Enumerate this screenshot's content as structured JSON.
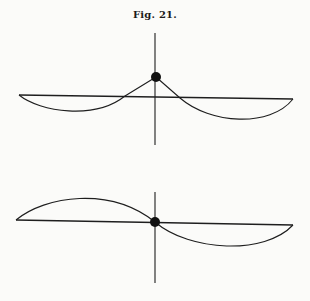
{
  "figure": {
    "title": "Fig. 21.",
    "ink_color": "#1e1e1e",
    "paper_color": "#fbfbf9",
    "panels": [
      {
        "name": "top",
        "description": "Taut string raised at center point; two sagging arcs below baseline",
        "baseline": {
          "x1": 19,
          "y1": 95,
          "x2": 293,
          "y2": 99
        },
        "axis": {
          "x": 155,
          "y1": 33,
          "y2": 145
        },
        "dot": {
          "cx": 156,
          "cy": 77,
          "r": 5
        },
        "curves": [
          "M19,95 C40,112 95,120 125,96 L156,77",
          "M156,77 L180,98 C210,124 270,128 293,99"
        ]
      },
      {
        "name": "bottom",
        "description": "String passing through center point; antisymmetric wave shape",
        "baseline": {
          "x1": 16,
          "y1": 220,
          "x2": 293,
          "y2": 225
        },
        "axis": {
          "x": 155,
          "y1": 192,
          "y2": 283
        },
        "dot": {
          "cx": 155,
          "cy": 222,
          "r": 5
        },
        "curves": [
          "M16,220 C45,196 110,186 155,222",
          "M155,222 C190,252 265,255 293,225"
        ]
      }
    ]
  }
}
